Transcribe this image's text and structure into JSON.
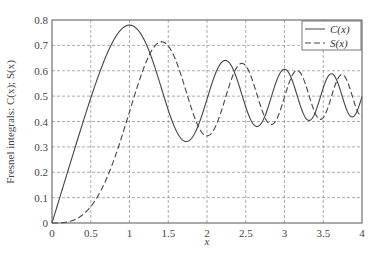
{
  "chart_data": {
    "type": "line",
    "title": "",
    "xlabel": "x",
    "ylabel": "Fresnel integrals: C(x); S(x)",
    "xlim": [
      0,
      4
    ],
    "ylim": [
      0,
      0.8
    ],
    "xticks": [
      "0",
      "0.5",
      "1",
      "1.5",
      "2",
      "2.5",
      "3",
      "3.5",
      "4"
    ],
    "yticks": [
      "0",
      "0.1",
      "0.2",
      "0.3",
      "0.4",
      "0.5",
      "0.6",
      "0.7",
      "0.8"
    ],
    "grid": true,
    "legend_position": "upper right",
    "series": [
      {
        "name": "C(x)",
        "style": "solid",
        "x": [
          0,
          0.5,
          1.0,
          1.5,
          2.0,
          2.5,
          3.0,
          3.5,
          4.0
        ],
        "values": [
          0,
          0.4923,
          0.7799,
          0.4453,
          0.4883,
          0.4574,
          0.6058,
          0.5326,
          0.4984
        ]
      },
      {
        "name": "S(x)",
        "style": "dashed",
        "x": [
          0,
          0.5,
          1.0,
          1.5,
          2.0,
          2.5,
          3.0,
          3.5,
          4.0
        ],
        "values": [
          0,
          0.0647,
          0.4383,
          0.6975,
          0.3434,
          0.6192,
          0.4963,
          0.4152,
          0.4205
        ]
      }
    ]
  }
}
